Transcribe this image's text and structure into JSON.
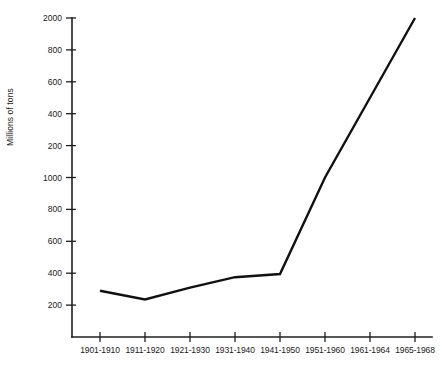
{
  "chart_data": {
    "type": "line",
    "title": "",
    "subtitle": "",
    "xlabel": "",
    "ylabel": "Millions of tons",
    "grid": false,
    "legend": false,
    "categories": [
      "1901-1910",
      "1911-1920",
      "1921-1930",
      "1931-1940",
      "1941-1950",
      "1951-1960",
      "1961-1964",
      "1965-1968"
    ],
    "y_tick_labels": [
      "2000",
      "800",
      "600",
      "400",
      "200",
      "1000",
      "800",
      "600",
      "400",
      "200"
    ],
    "y_tick_positions": [
      2000,
      1800,
      1600,
      1400,
      1200,
      1000,
      800,
      600,
      400,
      200
    ],
    "ylim": [
      0,
      2000
    ],
    "series": [
      {
        "name": "World production",
        "values": [
          290,
          235,
          310,
          375,
          395,
          1000,
          1500,
          2000
        ]
      }
    ]
  }
}
